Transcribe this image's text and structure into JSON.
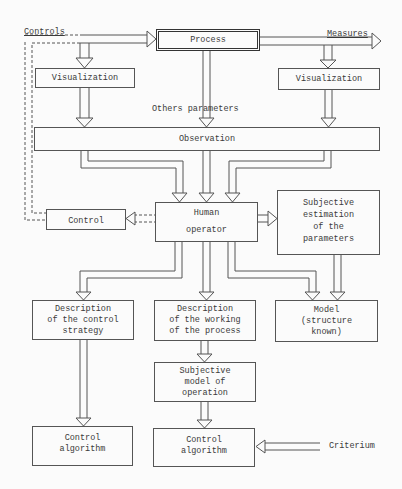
{
  "diagram": {
    "nodes": {
      "process": {
        "label": "Process"
      },
      "visualization_left": {
        "label": "Visualization"
      },
      "visualization_right": {
        "label": "Visualization"
      },
      "observation": {
        "label": "Observation"
      },
      "human_operator": {
        "line1": "Human",
        "line2": "operator"
      },
      "control": {
        "label": "Control"
      },
      "subjective_estimation": {
        "lines": [
          "Subjective",
          "estimation",
          "of the",
          "parameters"
        ]
      },
      "desc_control_strategy": {
        "lines": [
          "Description",
          "of the control",
          "strategy"
        ]
      },
      "desc_working_process": {
        "lines": [
          "Description",
          "of the working",
          "of the process"
        ]
      },
      "model": {
        "lines": [
          "Model",
          "(structure",
          "known)"
        ]
      },
      "subjective_model": {
        "lines": [
          "Subjective",
          "model of",
          "operation"
        ]
      },
      "control_algorithm_left": {
        "lines": [
          "Control",
          "algorithm"
        ]
      },
      "control_algorithm_right": {
        "lines": [
          "Control",
          "algorithm"
        ]
      }
    },
    "labels": {
      "controls": "Controls",
      "measures": "Measures",
      "others_parameters": "Others parameters",
      "criterium": "Criterium"
    }
  }
}
